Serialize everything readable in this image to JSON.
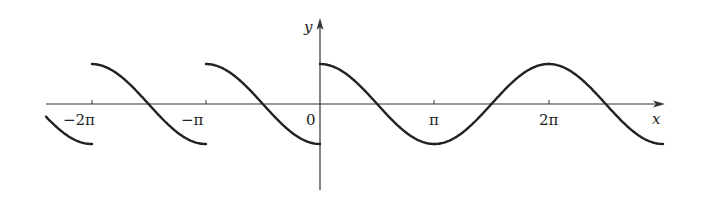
{
  "chart_data": {
    "type": "line",
    "title": "",
    "xlabel": "x",
    "ylabel": "y",
    "function": "y = cos(x - kπ) on [kπ, (k+1)π), periodic with period π (sawtooth-like cosine segments with jump discontinuities at multiples of π)",
    "x_ticks": [
      "-2π",
      "-π",
      "0",
      "π",
      "2π"
    ],
    "x_tick_values": [
      -6.2832,
      -3.1416,
      0,
      3.1416,
      6.2832
    ],
    "xlim": [
      -2.4,
      3.2
    ],
    "ylim": [
      -1.5,
      2.1
    ],
    "series": [
      {
        "name": "curve",
        "segments": [
          {
            "x_range": [
              "-2.4π",
              "-2π"
            ],
            "y_start": 0.31,
            "y_end": -1
          },
          {
            "x_range": [
              "-2π",
              "-π"
            ],
            "y_start": 1,
            "y_end": -1
          },
          {
            "x_range": [
              "-π",
              "0"
            ],
            "y_start": 1,
            "y_end": -1
          },
          {
            "x_range": [
              "0",
              "π"
            ],
            "y_start": 1,
            "y_end": -1
          },
          {
            "x_range": [
              "π",
              "2π"
            ],
            "y_start": 1,
            "y_end": -1
          },
          {
            "x_range": [
              "2π",
              "3π"
            ],
            "y_start": 1,
            "y_end": -1
          }
        ]
      }
    ],
    "grid": false,
    "legend": null
  },
  "labels": {
    "x_axis": "x",
    "y_axis": "y",
    "origin": "0",
    "tick_neg2pi": "−2π",
    "tick_negpi": "−π",
    "tick_pi": "π",
    "tick_2pi": "2π"
  },
  "colors": {
    "curve": "#222222",
    "axis": "#333333"
  }
}
